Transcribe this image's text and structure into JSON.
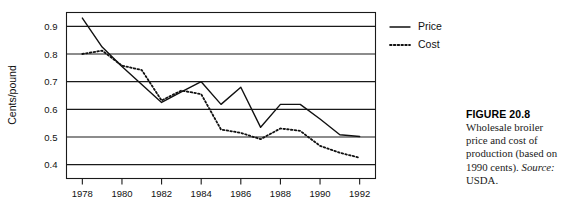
{
  "figure": {
    "caption_heading": "FIGURE 20.8",
    "caption_body_part1": "Wholesale broiler price and cost of production (based on 1990 cents). ",
    "caption_source_label": "Source:",
    "caption_body_part2": " USDA."
  },
  "chart_data": {
    "type": "line",
    "title": "",
    "xlabel": "",
    "ylabel": "Cents/pound",
    "xlim": [
      1977.2,
      1992.8
    ],
    "ylim": [
      0.35,
      0.95
    ],
    "grid": true,
    "grid_axis": "y",
    "legend_position": "right",
    "x": [
      1978,
      1979,
      1980,
      1981,
      1982,
      1983,
      1984,
      1985,
      1986,
      1987,
      1988,
      1989,
      1990,
      1991,
      1992
    ],
    "xticks": [
      1978,
      1980,
      1982,
      1984,
      1986,
      1988,
      1990,
      1992
    ],
    "xtick_labels": [
      "1978",
      "1980",
      "1982",
      "1984",
      "1986",
      "1988",
      "1990",
      "1992"
    ],
    "yticks": [
      0.4,
      0.5,
      0.6,
      0.7,
      0.8,
      0.9
    ],
    "ytick_labels": [
      "0.4",
      "0.5",
      "0.6",
      "0.7",
      "0.8",
      "0.9"
    ],
    "series": [
      {
        "name": "Price",
        "style": "solid",
        "color": "#111111",
        "values": [
          0.93,
          0.825,
          0.755,
          0.69,
          0.625,
          0.663,
          0.7,
          0.618,
          0.68,
          0.535,
          0.618,
          0.618,
          0.565,
          0.508,
          0.502
        ]
      },
      {
        "name": "Cost",
        "style": "dotted",
        "color": "#111111",
        "values": [
          0.8,
          0.812,
          0.758,
          0.742,
          0.632,
          0.668,
          0.655,
          0.527,
          0.515,
          0.492,
          0.531,
          0.522,
          0.468,
          0.443,
          0.425
        ]
      }
    ],
    "legend": [
      "Price",
      "Cost"
    ]
  }
}
